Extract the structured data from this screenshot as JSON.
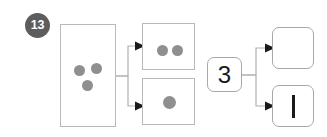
{
  "badge": {
    "label": "13",
    "color": "#5d5d5d",
    "text_color": "#ffffff"
  },
  "palette": {
    "dot_color": "#8f8f8f",
    "box_border": "#b9b9b9",
    "rounded_box_border": "#a8a8a8",
    "connector": "#b0b0b0",
    "arrowhead": "#1a1a1a",
    "glyph": "#1a1a1a",
    "background": "#ffffff"
  },
  "diagram": {
    "type": "decomposition-flowchart",
    "nodes": [
      {
        "id": "source",
        "name": "source-group-box",
        "shape": "rectangle",
        "corner": "square",
        "content_type": "dots",
        "dot_count": 3,
        "dot_layout": "triangle",
        "label": ""
      },
      {
        "id": "part-two",
        "name": "two-dot-box",
        "shape": "rectangle",
        "corner": "square",
        "content_type": "dots",
        "dot_count": 2,
        "dot_layout": "horizontal-pair",
        "label": ""
      },
      {
        "id": "part-one",
        "name": "one-dot-box",
        "shape": "rectangle",
        "corner": "square",
        "content_type": "dots",
        "dot_count": 1,
        "dot_layout": "center",
        "label": ""
      },
      {
        "id": "numeral",
        "name": "numeral-box",
        "shape": "rounded-rectangle",
        "corner": "rounded",
        "content_type": "text",
        "label": "3"
      },
      {
        "id": "answer-top",
        "name": "empty-answer-box",
        "shape": "rounded-rectangle",
        "corner": "rounded",
        "content_type": "empty",
        "label": ""
      },
      {
        "id": "answer-bottom",
        "name": "tally-answer-box",
        "shape": "rounded-rectangle",
        "corner": "rounded",
        "content_type": "tally-mark",
        "tally_count": 1,
        "label": "|"
      }
    ],
    "connectors": [
      {
        "name": "source-to-two",
        "from": "source",
        "to": "part-two",
        "style": "elbow-arrow"
      },
      {
        "name": "source-to-one",
        "from": "source",
        "to": "part-one",
        "style": "elbow-arrow"
      },
      {
        "name": "numeral-to-answer-top",
        "from": "numeral",
        "to": "answer-top",
        "style": "elbow-arrow"
      },
      {
        "name": "numeral-to-answer-bottom",
        "from": "numeral",
        "to": "answer-bottom",
        "style": "elbow-arrow"
      }
    ]
  }
}
